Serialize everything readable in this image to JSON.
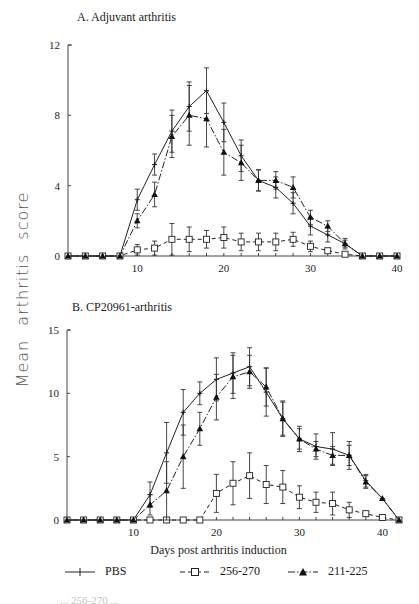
{
  "figure": {
    "ylabel": "Mean arthritis score",
    "xlabel": "Days post arthritis induction",
    "caption_fragment": "...  256-270 ...",
    "legend": [
      {
        "name": "PBS",
        "marker": "plus",
        "line": "solid"
      },
      {
        "name": "256-270",
        "marker": "open-square",
        "line": "dashed"
      },
      {
        "name": "211-225",
        "marker": "filled-triangle",
        "line": "dash-dot"
      }
    ]
  },
  "chart_data": [
    {
      "type": "line",
      "title": "A. Adjuvant arthritis",
      "xlabel": "",
      "ylabel": "Mean arthritis score",
      "xlim": [
        2,
        40
      ],
      "ylim": [
        0,
        12
      ],
      "xticks": [
        10,
        20,
        30,
        40
      ],
      "yticks": [
        0,
        4,
        8,
        12
      ],
      "x": [
        2,
        4,
        6,
        8,
        10,
        12,
        14,
        16,
        18,
        20,
        22,
        24,
        26,
        28,
        30,
        32,
        34,
        36,
        38,
        40
      ],
      "series": [
        {
          "name": "PBS",
          "values": [
            0,
            0,
            0,
            0,
            3.2,
            5.2,
            7.1,
            8.5,
            9.4,
            7.6,
            5.7,
            4.3,
            3.9,
            3.0,
            1.7,
            1.2,
            0.7,
            0,
            0,
            0
          ],
          "errors": [
            0,
            0,
            0,
            0,
            0.6,
            0.6,
            1.2,
            1.4,
            1.3,
            1.1,
            0.9,
            0.6,
            0.6,
            0.6,
            0.5,
            0.4,
            0.2,
            0,
            0,
            0
          ]
        },
        {
          "name": "256-270",
          "values": [
            0,
            0,
            0,
            0,
            0.35,
            0.45,
            0.95,
            0.95,
            0.95,
            1.05,
            0.8,
            0.8,
            0.8,
            0.95,
            0.55,
            0.3,
            0.1,
            0,
            0,
            0
          ],
          "errors": [
            0,
            0,
            0,
            0,
            0.3,
            0.4,
            0.9,
            0.7,
            0.5,
            0.6,
            0.5,
            0.5,
            0.5,
            0.4,
            0.3,
            0.1,
            0.1,
            0,
            0,
            0
          ]
        },
        {
          "name": "211-225",
          "values": [
            0,
            0,
            0,
            0,
            2.0,
            3.5,
            6.8,
            8.0,
            7.8,
            5.9,
            5.3,
            4.3,
            4.3,
            3.9,
            2.2,
            1.7,
            0.7,
            0,
            0,
            0
          ],
          "errors": [
            0,
            0,
            0,
            0,
            0.4,
            0.7,
            1.2,
            1.7,
            1.6,
            1.3,
            1.0,
            0.6,
            0.5,
            0.6,
            0.4,
            0.3,
            0.3,
            0,
            0,
            0
          ]
        }
      ],
      "grid": false,
      "legend_position": "bottom"
    },
    {
      "type": "line",
      "title": "B. CP20961-arthritis",
      "xlabel": "Days post arthritis induction",
      "ylabel": "Mean arthritis score",
      "xlim": [
        2,
        42
      ],
      "ylim": [
        0,
        15
      ],
      "xticks": [
        10,
        20,
        30,
        40
      ],
      "yticks": [
        0,
        5,
        10,
        15
      ],
      "x": [
        2,
        4,
        6,
        8,
        10,
        12,
        14,
        16,
        18,
        20,
        22,
        24,
        26,
        28,
        30,
        32,
        34,
        36,
        38,
        40,
        42
      ],
      "series": [
        {
          "name": "PBS",
          "values": [
            0,
            0,
            0,
            0,
            0,
            2.0,
            5.3,
            8.5,
            10.0,
            11.1,
            11.6,
            12.1,
            10.1,
            8.0,
            6.4,
            5.8,
            5.6,
            5.1,
            3.1,
            1.7,
            0
          ],
          "errors": [
            0,
            0,
            0,
            0,
            0,
            1.0,
            2.4,
            1.8,
            0.9,
            1.7,
            1.6,
            1.5,
            1.9,
            1.4,
            1.0,
            1.0,
            1.3,
            1.1,
            0.5,
            0,
            0
          ]
        },
        {
          "name": "256-270",
          "values": [
            0,
            0,
            0,
            0,
            0,
            0,
            0,
            0,
            0,
            2.1,
            2.9,
            3.5,
            2.8,
            2.6,
            1.8,
            1.4,
            1.3,
            0.8,
            0.5,
            0.2,
            0
          ],
          "errors": [
            0,
            0,
            0,
            0,
            0,
            0,
            0,
            0,
            0,
            1.5,
            1.7,
            1.8,
            1.5,
            1.3,
            0.9,
            0.8,
            0.9,
            0.6,
            0,
            0,
            0
          ]
        },
        {
          "name": "211-225",
          "values": [
            0,
            0,
            0,
            0,
            0,
            1.2,
            2.3,
            5.0,
            7.2,
            9.7,
            11.3,
            11.7,
            10.5,
            8.0,
            6.4,
            5.6,
            5.1,
            5.1,
            3.0,
            1.7,
            0
          ],
          "errors": [
            0,
            0,
            0,
            0,
            0,
            0.8,
            2.3,
            2.5,
            1.3,
            1.8,
            1.7,
            1.3,
            1.5,
            1.3,
            0.8,
            0.6,
            0.7,
            0.8,
            0.5,
            0,
            0
          ]
        }
      ],
      "grid": false,
      "legend_position": "bottom"
    }
  ]
}
